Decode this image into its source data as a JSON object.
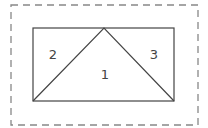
{
  "diagram": {
    "outer_border": {
      "style": "dashed",
      "x": 11,
      "y": 5,
      "width": 187,
      "height": 120
    },
    "rectangle": {
      "x": 33,
      "y": 28,
      "width": 141,
      "height": 73
    },
    "triangle": {
      "apex": [
        104,
        28
      ],
      "left": [
        33,
        101
      ],
      "right": [
        174,
        101
      ]
    },
    "regions": [
      {
        "label": "1",
        "x": 105,
        "y": 79
      },
      {
        "label": "2",
        "x": 53,
        "y": 59
      },
      {
        "label": "3",
        "x": 154,
        "y": 59
      }
    ],
    "colors": {
      "stroke": "#444444",
      "dash": "#888888"
    }
  }
}
